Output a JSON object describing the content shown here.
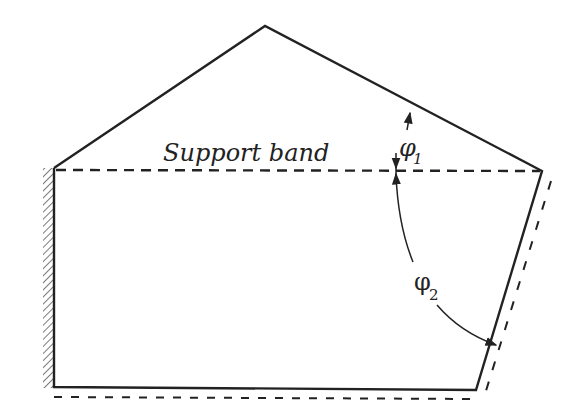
{
  "diagram": {
    "labels": {
      "support_band": "Support band",
      "phi1": "φ",
      "phi1_sub": "1",
      "phi2": "φ",
      "phi2_sub": "2"
    },
    "colors": {
      "stroke": "#222222",
      "background": "#ffffff"
    }
  }
}
